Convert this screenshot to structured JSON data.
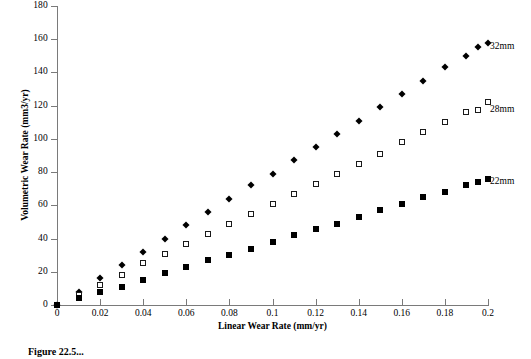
{
  "chart_data": {
    "type": "scatter",
    "title": "",
    "xlabel": "Linear Wear Rate (mm/yr)",
    "ylabel": "Volumetric Wear Rate (mm3/yr)",
    "xlim": [
      0,
      0.2
    ],
    "ylim": [
      0,
      180
    ],
    "xticks": [
      0,
      0.02,
      0.04,
      0.06,
      0.08,
      0.1,
      0.12,
      0.14,
      0.16,
      0.18,
      0.2
    ],
    "xtick_labels": [
      "0",
      "0.02",
      "0.04",
      "0.06",
      "0.08",
      "0.1",
      "0.12",
      "0.14",
      "0.16",
      "0.18",
      "0.2"
    ],
    "yticks": [
      0,
      20,
      40,
      60,
      80,
      100,
      120,
      140,
      160,
      180
    ],
    "ytick_labels": [
      "0",
      "20",
      "40",
      "60",
      "80",
      "100",
      "120",
      "140",
      "160",
      "180"
    ],
    "grid": false,
    "legend_position": "right",
    "x": [
      0,
      0.01,
      0.02,
      0.03,
      0.04,
      0.05,
      0.06,
      0.07,
      0.08,
      0.09,
      0.1,
      0.11,
      0.12,
      0.13,
      0.14,
      0.15,
      0.16,
      0.17,
      0.18,
      0.19,
      0.2
    ],
    "series": [
      {
        "name": "32mm",
        "marker": "filled-diamond",
        "color": "#000000",
        "values": [
          0,
          8,
          16,
          24,
          32,
          40,
          48,
          56,
          64,
          72,
          79,
          87,
          95,
          103,
          111,
          119,
          127,
          135,
          143,
          150,
          158
        ]
      },
      {
        "name": "28mm",
        "marker": "open-square",
        "color": "#ffffff",
        "values": [
          0,
          6,
          12,
          18,
          25,
          31,
          37,
          43,
          49,
          55,
          61,
          67,
          73,
          79,
          85,
          91,
          98,
          104,
          110,
          116,
          122
        ]
      },
      {
        "name": "22mm",
        "marker": "filled-square",
        "color": "#000000",
        "values": [
          0,
          4,
          8,
          11,
          15,
          19,
          23,
          27,
          30,
          34,
          38,
          42,
          46,
          49,
          53,
          57,
          61,
          65,
          68,
          72,
          76
        ]
      }
    ]
  },
  "legend": {
    "items": [
      {
        "label": "32mm",
        "marker": "filled-diamond"
      },
      {
        "label": "28mm",
        "marker": "open-square"
      },
      {
        "label": "22mm",
        "marker": "filled-square"
      }
    ]
  },
  "caption": "Figure 22.5..."
}
